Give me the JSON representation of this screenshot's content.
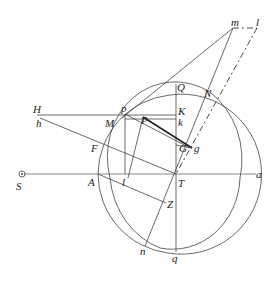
{
  "diagram": {
    "type": "geometric-construction",
    "labels": {
      "S": "S",
      "H": "H",
      "h": "h",
      "p": "p",
      "P": "P",
      "M": "M",
      "F": "F",
      "A": "A",
      "l_low": "l",
      "T": "T",
      "a": "a",
      "Q": "Q",
      "N": "N",
      "K": "K",
      "k": "k",
      "G": "G",
      "g": "g",
      "Z": "Z",
      "n": "n",
      "q": "q",
      "m": "m",
      "l_top": "l"
    },
    "colors": {
      "line": "#444444",
      "axis": "#888888",
      "text": "#222222",
      "background": "#ffffff"
    }
  }
}
